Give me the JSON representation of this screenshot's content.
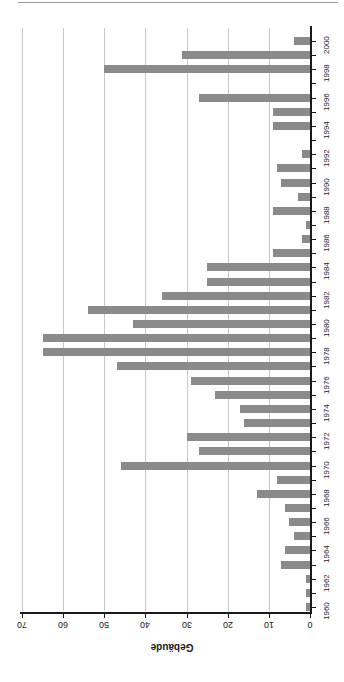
{
  "chart_data": {
    "type": "bar",
    "orientation": "horizontal",
    "rotated_180": true,
    "title": "",
    "subtitle": "",
    "xlabel": "Gebäude",
    "ylabel": "",
    "xlim": [
      0,
      70
    ],
    "ylim_categories": [
      "1960",
      "2000"
    ],
    "grid": true,
    "legend": null,
    "bar_color": "#8a8a8a",
    "axis_color": "#1a1a1a",
    "grid_color": "#c9c9c9",
    "value_ticks": [
      "0",
      "10",
      "20",
      "30",
      "40",
      "50",
      "60",
      "70"
    ],
    "value_tick_values": [
      0,
      10,
      20,
      30,
      40,
      50,
      60,
      70
    ],
    "category_ticks": [
      "1960",
      "1962",
      "1964",
      "1966",
      "1968",
      "1970",
      "1972",
      "1974",
      "1976",
      "1978",
      "1980",
      "1982",
      "1984",
      "1986",
      "1988",
      "1990",
      "1992",
      "1994",
      "1996",
      "1998",
      "2000"
    ],
    "categories": [
      "1960",
      "1961",
      "1962",
      "1963",
      "1964",
      "1965",
      "1966",
      "1967",
      "1968",
      "1969",
      "1970",
      "1971",
      "1972",
      "1973",
      "1974",
      "1975",
      "1976",
      "1977",
      "1978",
      "1979",
      "1980",
      "1981",
      "1982",
      "1983",
      "1984",
      "1985",
      "1986",
      "1987",
      "1988",
      "1989",
      "1990",
      "1991",
      "1992",
      "1993",
      "1994",
      "1995",
      "1996",
      "1997",
      "1998",
      "1999",
      "2000"
    ],
    "values": [
      1,
      1,
      1,
      7,
      6,
      4,
      5,
      6,
      13,
      8,
      46,
      27,
      30,
      16,
      17,
      23,
      29,
      47,
      65,
      65,
      43,
      54,
      36,
      25,
      25,
      9,
      2,
      1,
      9,
      3,
      7,
      8,
      2,
      0,
      9,
      9,
      27,
      0,
      50,
      31,
      4
    ]
  }
}
